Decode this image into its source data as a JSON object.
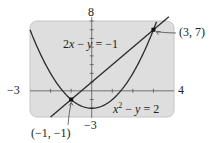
{
  "chart_data": {
    "type": "line",
    "title": "",
    "xlabel": "",
    "ylabel": "",
    "xlim": [
      -3,
      4
    ],
    "ylim": [
      -3,
      8
    ],
    "grid": false,
    "window_labels": {
      "xmin": "−3",
      "xmax": "4",
      "ymin": "−3",
      "ymax": "8"
    },
    "series": [
      {
        "name": "2x − y = −1",
        "equation": "y = 2x + 1",
        "kind": "line",
        "points": [
          [
            -2,
            -3
          ],
          [
            -1,
            -1
          ],
          [
            0,
            1
          ],
          [
            1,
            3
          ],
          [
            2,
            5
          ],
          [
            3,
            7
          ],
          [
            3.5,
            8
          ]
        ]
      },
      {
        "name": "x² − y = 2",
        "equation": "y = x² − 2",
        "kind": "parabola",
        "points": [
          [
            -3,
            7
          ],
          [
            -2,
            2
          ],
          [
            -1,
            -1
          ],
          [
            0,
            -2
          ],
          [
            1,
            -1
          ],
          [
            2,
            2
          ],
          [
            3,
            7
          ],
          [
            3.16,
            8
          ]
        ]
      }
    ],
    "annotations": [
      {
        "text": "(3, 7)",
        "x": 3,
        "y": 7
      },
      {
        "text": "(−1, −1)",
        "x": -1,
        "y": -1
      }
    ]
  },
  "labels": {
    "ymax": "8",
    "ymin": "−3",
    "xmin": "−3",
    "xmax": "4",
    "line_eq": {
      "a": "2",
      "x": "x",
      "rest": " − ",
      "y": "y",
      "end": " = −1"
    },
    "parabola_eq": {
      "x": "x",
      "sup": "2",
      "rest": " − ",
      "y": "y",
      "end": " = 2"
    },
    "point_a": "(3, 7)",
    "point_b": "(−1, −1)"
  },
  "colors": {
    "window_bg": "#dedede",
    "window_border": "#b8b8b8",
    "curve": "#2a2a2a",
    "axis": "#555555"
  }
}
